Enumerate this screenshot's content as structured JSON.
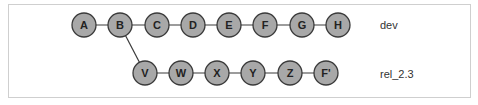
{
  "diagram": {
    "colors": {
      "node_fill": "#a8a8a8",
      "node_stroke": "#3a3a3a",
      "edge": "#3a3a3a",
      "frame": "#cfcfcf"
    },
    "branches": [
      {
        "name": "dev",
        "label": "dev",
        "commits": [
          "A",
          "B",
          "C",
          "D",
          "E",
          "F",
          "G",
          "H"
        ]
      },
      {
        "name": "rel_2.3",
        "label": "rel_2.3",
        "branches_from": "B",
        "commits": [
          "V",
          "W",
          "X",
          "Y",
          "Z",
          "F'"
        ]
      }
    ],
    "nodes": {
      "A": "A",
      "B": "B",
      "C": "C",
      "D": "D",
      "E": "E",
      "F": "F",
      "G": "G",
      "H": "H",
      "V": "V",
      "W": "W",
      "X": "X",
      "Y": "Y",
      "Z": "Z",
      "Fp": "F'"
    },
    "labels": {
      "dev": "dev",
      "rel": "rel_2.3"
    }
  }
}
